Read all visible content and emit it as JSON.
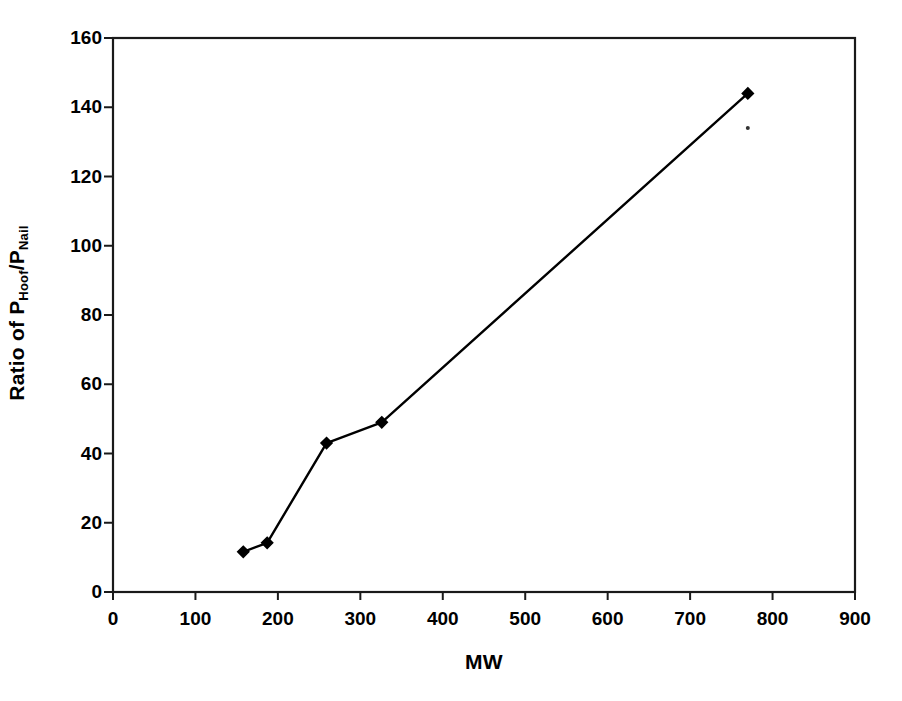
{
  "chart_data": {
    "type": "line",
    "title": "",
    "xlabel": "MW",
    "ylabel": "Ratio of P_Hoof/P_Nail",
    "ylabel_parts": {
      "prefix": "Ratio of P",
      "sub1": "Hoof",
      "mid": "/P",
      "sub2": "Nail"
    },
    "xlim": [
      0,
      900
    ],
    "ylim": [
      0,
      160
    ],
    "xticks": [
      0,
      100,
      200,
      300,
      400,
      500,
      600,
      700,
      800,
      900
    ],
    "yticks": [
      0,
      20,
      40,
      60,
      80,
      100,
      120,
      140,
      160
    ],
    "xtick_labels": [
      "0",
      "100",
      "200",
      "300",
      "400",
      "500",
      "600",
      "700",
      "800",
      "900"
    ],
    "ytick_labels": [
      "0",
      "20",
      "40",
      "60",
      "80",
      "100",
      "120",
      "140",
      "160"
    ],
    "grid": false,
    "legend": false,
    "series": [
      {
        "name": "Ratio of P_Hoof/P_Nail",
        "marker": "diamond",
        "color": "#000000",
        "x": [
          158,
          187,
          259,
          326,
          770
        ],
        "y": [
          11.6,
          14.2,
          43,
          49,
          144
        ]
      }
    ],
    "annotations": [
      {
        "name": "stray-dot",
        "x": 770,
        "y": 134
      }
    ]
  }
}
